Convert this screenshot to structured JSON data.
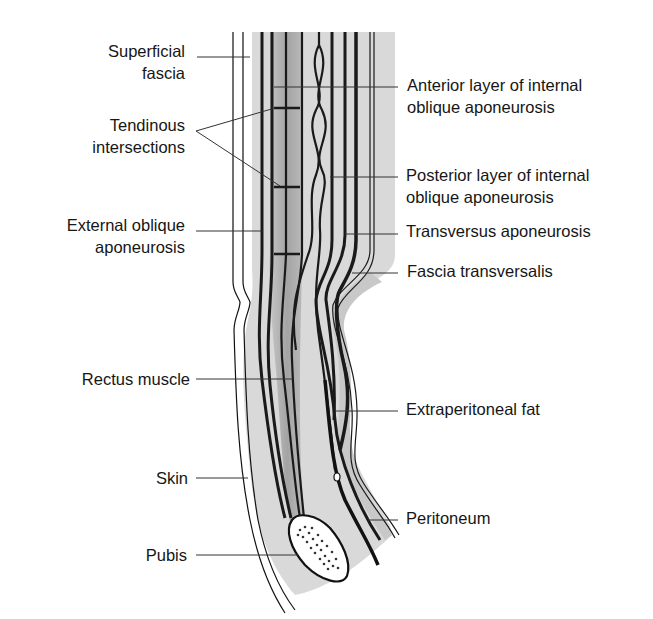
{
  "figure": {
    "colors": {
      "background": "#ffffff",
      "outline": "#111111",
      "leader_line": "#333333",
      "fat_tissue": "#d4d4d4",
      "muscle_tissue": "#a8a8a8",
      "bone_fill": "#ffffff"
    }
  },
  "labels_left": [
    {
      "id": "superficial-fascia",
      "lines": [
        "Superficial",
        "fascia"
      ]
    },
    {
      "id": "tendinous-intersections",
      "lines": [
        "Tendinous",
        "intersections"
      ]
    },
    {
      "id": "external-oblique-aponeurosis",
      "lines": [
        "External oblique",
        "aponeurosis"
      ]
    },
    {
      "id": "rectus-muscle",
      "lines": [
        "Rectus muscle"
      ]
    },
    {
      "id": "skin",
      "lines": [
        "Skin"
      ]
    },
    {
      "id": "pubis",
      "lines": [
        "Pubis"
      ]
    }
  ],
  "labels_right": [
    {
      "id": "anterior-layer-internal-oblique",
      "lines": [
        "Anterior layer of internal",
        "oblique aponeurosis"
      ]
    },
    {
      "id": "posterior-layer-internal-oblique",
      "lines": [
        "Posterior layer of internal",
        "oblique aponeurosis"
      ]
    },
    {
      "id": "transversus-aponeurosis",
      "lines": [
        "Transversus aponeurosis"
      ]
    },
    {
      "id": "fascia-transversalis",
      "lines": [
        "Fascia transversalis"
      ]
    },
    {
      "id": "extraperitoneal-fat",
      "lines": [
        "Extraperitoneal fat"
      ]
    },
    {
      "id": "peritoneum",
      "lines": [
        "Peritoneum"
      ]
    }
  ]
}
